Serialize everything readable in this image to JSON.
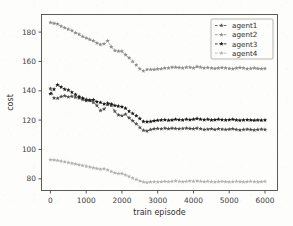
{
  "chart_data": {
    "type": "line",
    "title": "",
    "xlabel": "train episode",
    "ylabel": "cost",
    "xlim": [
      -250,
      6350
    ],
    "ylim": [
      72,
      192
    ],
    "xticks": [
      0,
      1000,
      2000,
      3000,
      4000,
      5000,
      6000
    ],
    "yticks": [
      80,
      100,
      120,
      140,
      160,
      180
    ],
    "xtick_labels": [
      "0",
      "1000",
      "2000",
      "3000",
      "4000",
      "5000",
      "6000"
    ],
    "ytick_labels": [
      "80",
      "100",
      "120",
      "140",
      "160",
      "180"
    ],
    "grid": false,
    "legend_position": "upper right",
    "x": [
      0,
      100,
      200,
      300,
      400,
      500,
      600,
      700,
      800,
      900,
      1000,
      1100,
      1200,
      1300,
      1400,
      1500,
      1600,
      1700,
      1800,
      1900,
      2000,
      2100,
      2200,
      2300,
      2400,
      2500,
      2600,
      2700,
      2800,
      2900,
      3000,
      3100,
      3200,
      3300,
      3400,
      3500,
      3600,
      3700,
      3800,
      3900,
      4000,
      4100,
      4200,
      4300,
      4400,
      4500,
      4600,
      4700,
      4800,
      4900,
      5000,
      5100,
      5200,
      5300,
      5400,
      5500,
      5600,
      5700,
      5800,
      5900,
      6000
    ],
    "series": [
      {
        "name": "agent1",
        "color": "#4d4d4d",
        "linestyle": "dashed",
        "marker": "star",
        "values": [
          141.5,
          135.0,
          134.8,
          136.0,
          136.5,
          135.8,
          136.2,
          135.5,
          135.0,
          134.0,
          133.2,
          133.5,
          132.0,
          130.0,
          126.5,
          127.5,
          130.5,
          130.0,
          126.0,
          123.5,
          123.0,
          124.0,
          121.5,
          119.5,
          117.5,
          115.0,
          113.0,
          112.5,
          113.5,
          114.0,
          114.2,
          114.0,
          114.5,
          114.0,
          114.5,
          114.2,
          114.0,
          114.3,
          114.5,
          114.2,
          114.0,
          114.5,
          114.0,
          113.5,
          113.8,
          114.0,
          113.5,
          114.0,
          113.8,
          113.5,
          113.8,
          114.0,
          113.5,
          113.2,
          113.5,
          113.8,
          113.5,
          113.2,
          113.5,
          113.8,
          113.5
        ]
      },
      {
        "name": "agent2",
        "color": "#8c8c8c",
        "linestyle": "dashed",
        "marker": "star",
        "values": [
          186.5,
          186.0,
          185.5,
          184.0,
          183.0,
          182.0,
          181.0,
          179.5,
          178.5,
          177.0,
          176.0,
          175.0,
          174.0,
          172.5,
          171.5,
          172.0,
          174.0,
          170.0,
          167.5,
          167.0,
          167.0,
          164.5,
          162.5,
          160.0,
          157.5,
          155.0,
          153.5,
          154.5,
          154.5,
          154.5,
          154.8,
          155.0,
          155.5,
          155.5,
          156.0,
          156.0,
          155.8,
          155.5,
          156.0,
          156.0,
          155.5,
          156.5,
          156.0,
          155.5,
          155.8,
          155.5,
          155.2,
          155.5,
          155.8,
          155.5,
          155.2,
          155.0,
          155.5,
          155.8,
          155.5,
          155.0,
          155.2,
          155.5,
          155.2,
          155.0,
          155.2
        ]
      },
      {
        "name": "agent3",
        "color": "#1a1a1a",
        "linestyle": "dashed",
        "marker": "star",
        "values": [
          138.0,
          141.0,
          144.0,
          142.5,
          141.0,
          140.5,
          139.0,
          137.5,
          136.0,
          135.0,
          134.0,
          133.5,
          133.8,
          132.5,
          132.0,
          131.0,
          131.5,
          131.0,
          130.0,
          129.5,
          129.0,
          128.0,
          126.0,
          124.5,
          123.0,
          121.0,
          119.0,
          118.8,
          119.0,
          119.5,
          119.8,
          120.0,
          120.2,
          119.8,
          120.0,
          120.5,
          120.2,
          120.0,
          120.5,
          120.2,
          120.5,
          121.0,
          120.5,
          120.2,
          120.5,
          120.0,
          120.2,
          120.5,
          120.2,
          120.0,
          120.2,
          120.5,
          120.0,
          119.8,
          120.0,
          120.2,
          120.0,
          119.8,
          120.0,
          119.8,
          120.0
        ]
      },
      {
        "name": "agent4",
        "color": "#b3b3b3",
        "linestyle": "dashed",
        "marker": "star",
        "values": [
          93.0,
          92.8,
          92.5,
          92.0,
          91.5,
          91.0,
          90.5,
          90.0,
          89.5,
          89.0,
          88.5,
          88.0,
          87.5,
          87.0,
          86.5,
          86.8,
          86.0,
          85.0,
          84.0,
          83.5,
          83.5,
          82.5,
          81.5,
          80.5,
          79.5,
          78.5,
          77.8,
          77.5,
          77.8,
          78.0,
          77.8,
          78.0,
          78.2,
          78.0,
          78.2,
          78.5,
          78.2,
          78.0,
          78.2,
          78.5,
          78.2,
          78.5,
          78.2,
          78.0,
          78.2,
          78.0,
          77.8,
          78.0,
          78.2,
          78.0,
          77.8,
          78.0,
          78.2,
          78.0,
          77.8,
          78.0,
          78.2,
          78.0,
          77.8,
          78.0,
          78.2
        ]
      }
    ]
  },
  "legend": {
    "entries": [
      "agent1",
      "agent2",
      "agent3",
      "agent4"
    ]
  }
}
